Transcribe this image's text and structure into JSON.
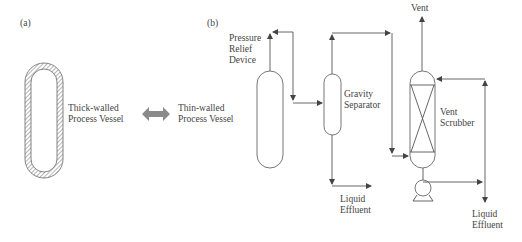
{
  "panels": {
    "a": {
      "label": "(a)",
      "thick_vessel": {
        "line1": "Thick-walled",
        "line2": "Process Vessel"
      },
      "thin_vessel": {
        "line1": "Thin-walled",
        "line2": "Process Vessel"
      },
      "arrow": "double-arrow",
      "arrow_color": "#8a8a8a"
    },
    "b": {
      "label": "(b)",
      "pressure_relief": {
        "line1": "Pressure",
        "line2": "Relief",
        "line3": "Device"
      },
      "gravity_separator": {
        "line1": "Gravity",
        "line2": "Separator"
      },
      "vent": "Vent",
      "vent_scrubber": {
        "line1": "Vent",
        "line2": "Scrubber"
      },
      "liquid_effluent_1": {
        "line1": "Liquid",
        "line2": "Effluent"
      },
      "liquid_effluent_2": {
        "line1": "Liquid",
        "line2": "Effluent"
      }
    }
  },
  "colors": {
    "line": "#555555",
    "text": "#444444",
    "hatch": "#777777"
  }
}
